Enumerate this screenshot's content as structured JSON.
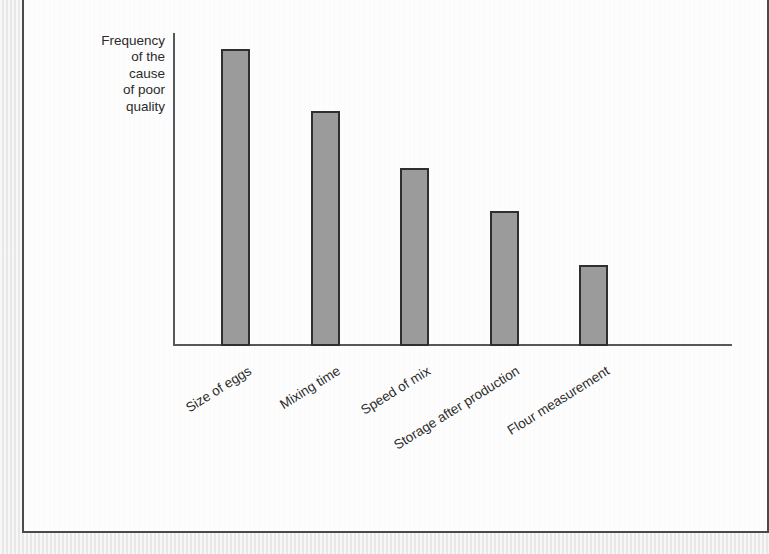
{
  "figure": {
    "panel_background": "#fdfdfd",
    "frame_color": "#4a4a4a",
    "page_background": "#efefef"
  },
  "axes": {
    "y_label": "Frequency\nof the\ncause\nof poor\nquality",
    "x_label": "",
    "axis_color": "#55595c"
  },
  "style": {
    "bar_fill": "#9b9b9b",
    "bar_stroke": "#2f2f2f",
    "text_color": "#2b2b2b"
  },
  "chart_data": {
    "type": "bar",
    "title": "",
    "subtitle": "",
    "xlabel": "",
    "ylabel": "Frequency of the cause of poor quality",
    "categories": [
      "Size of eggs",
      "Mixing time",
      "Speed of mix",
      "Storage after production",
      "Flour measurement"
    ],
    "values": [
      95,
      75,
      57,
      43,
      26
    ],
    "ylim": [
      0,
      100
    ],
    "grid": false,
    "legend": false,
    "tick_labels_y": [],
    "annotations": []
  }
}
